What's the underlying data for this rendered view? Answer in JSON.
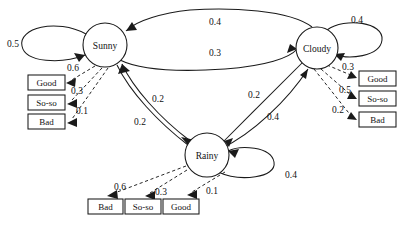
{
  "diagram": {
    "type": "hidden-markov-model-state-diagram",
    "states": [
      {
        "id": "sunny",
        "label": "Sunny",
        "cx": 105,
        "cy": 45,
        "r": 22
      },
      {
        "id": "cloudy",
        "label": "Cloudy",
        "cx": 317,
        "cy": 48,
        "r": 21
      },
      {
        "id": "rainy",
        "label": "Rainy",
        "cx": 207,
        "cy": 155,
        "r": 22
      }
    ],
    "observations": [
      {
        "id": "sunny-good",
        "label": "Good",
        "x": 28,
        "y": 75,
        "w": 37,
        "h": 15
      },
      {
        "id": "sunny-soso",
        "label": "So-so",
        "x": 28,
        "y": 95,
        "w": 37,
        "h": 15
      },
      {
        "id": "sunny-bad",
        "label": "Bad",
        "x": 28,
        "y": 114,
        "w": 37,
        "h": 15
      },
      {
        "id": "cloudy-good",
        "label": "Good",
        "x": 359,
        "y": 71,
        "w": 37,
        "h": 15
      },
      {
        "id": "cloudy-soso",
        "label": "So-so",
        "x": 359,
        "y": 91,
        "w": 37,
        "h": 15
      },
      {
        "id": "cloudy-bad",
        "label": "Bad",
        "x": 359,
        "y": 112,
        "w": 37,
        "h": 15
      },
      {
        "id": "rainy-bad",
        "label": "Bad",
        "x": 88,
        "y": 199,
        "w": 35,
        "h": 15
      },
      {
        "id": "rainy-soso",
        "label": "So-so",
        "x": 125,
        "y": 199,
        "w": 36,
        "h": 15
      },
      {
        "id": "rainy-good",
        "label": "Good",
        "x": 163,
        "y": 199,
        "w": 36,
        "h": 15
      }
    ],
    "transitions": [
      {
        "id": "sunny-sunny",
        "from": "sunny",
        "to": "sunny",
        "weight": "0.5",
        "wx": 13,
        "wy": 44
      },
      {
        "id": "cloudy-sunny",
        "from": "cloudy",
        "to": "sunny",
        "weight": "0.4",
        "wx": 215,
        "wy": 22
      },
      {
        "id": "sunny-cloudy",
        "from": "sunny",
        "to": "cloudy",
        "weight": "0.3",
        "wx": 215,
        "wy": 53
      },
      {
        "id": "cloudy-cloudy",
        "from": "cloudy",
        "to": "cloudy",
        "weight": "0.4",
        "wx": 357,
        "wy": 20
      },
      {
        "id": "sunny-rainy",
        "from": "sunny",
        "to": "rainy",
        "weight": "0.2",
        "wx": 158,
        "wy": 99
      },
      {
        "id": "rainy-sunny",
        "from": "rainy",
        "to": "sunny",
        "weight": "0.2",
        "wx": 140,
        "wy": 122
      },
      {
        "id": "cloudy-rainy",
        "from": "cloudy",
        "to": "rainy",
        "weight": "0.2",
        "wx": 254,
        "wy": 95
      },
      {
        "id": "rainy-cloudy",
        "from": "rainy",
        "to": "cloudy",
        "weight": "0.4",
        "wx": 273,
        "wy": 117
      },
      {
        "id": "rainy-rainy",
        "from": "rainy",
        "to": "rainy",
        "weight": "0.4",
        "wx": 291,
        "wy": 175
      }
    ],
    "emissions": [
      {
        "id": "sunny-to-good",
        "from": "sunny",
        "to": "sunny-good",
        "weight": "0.6",
        "wx": 73,
        "wy": 68
      },
      {
        "id": "sunny-to-soso",
        "from": "sunny",
        "to": "sunny-soso",
        "weight": "0.3",
        "wx": 77,
        "wy": 91
      },
      {
        "id": "sunny-to-bad",
        "from": "sunny",
        "to": "sunny-bad",
        "weight": "0.1",
        "wx": 82,
        "wy": 111
      },
      {
        "id": "cloudy-to-good",
        "from": "cloudy",
        "to": "cloudy-good",
        "weight": "0.3",
        "wx": 348,
        "wy": 67
      },
      {
        "id": "cloudy-to-soso",
        "from": "cloudy",
        "to": "cloudy-soso",
        "weight": "0.5",
        "wx": 345,
        "wy": 90
      },
      {
        "id": "cloudy-to-bad",
        "from": "cloudy",
        "to": "cloudy-bad",
        "weight": "0.2",
        "wx": 338,
        "wy": 110
      },
      {
        "id": "rainy-to-bad",
        "from": "rainy",
        "to": "rainy-bad",
        "weight": "0.6",
        "wx": 120,
        "wy": 187
      },
      {
        "id": "rainy-to-soso",
        "from": "rainy",
        "to": "rainy-soso",
        "weight": "0.3",
        "wx": 161,
        "wy": 192
      },
      {
        "id": "rainy-to-good",
        "from": "rainy",
        "to": "rainy-good",
        "weight": "0.1",
        "wx": 212,
        "wy": 191
      }
    ]
  }
}
